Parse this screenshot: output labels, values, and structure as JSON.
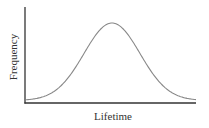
{
  "chart_data": {
    "type": "line",
    "title": "",
    "xlabel": "Lifetime",
    "ylabel": "Frequency",
    "grid": false,
    "legend": null,
    "x_ticks": [],
    "y_ticks": [],
    "series": [
      {
        "name": "distribution",
        "shape": "normal (bell curve)",
        "x": [
          0.0,
          0.1,
          0.2,
          0.3,
          0.4,
          0.5,
          0.6,
          0.7,
          0.8,
          0.9,
          1.0
        ],
        "values": [
          0.02,
          0.06,
          0.16,
          0.38,
          0.7,
          0.95,
          0.83,
          0.52,
          0.24,
          0.08,
          0.02
        ]
      }
    ],
    "curve_color": "#888888",
    "axis_color": "#333333"
  }
}
